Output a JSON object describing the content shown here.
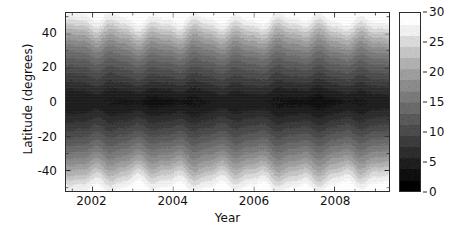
{
  "figure": {
    "kind": "filled-contour-heatmap",
    "background_color": "#ffffff",
    "axis_color": "#2b2b2b"
  },
  "xaxis": {
    "label": "Year",
    "ticks": [
      "2002",
      "2004",
      "2006",
      "2008"
    ],
    "tick_values": [
      2002,
      2004,
      2006,
      2008
    ],
    "range": [
      2001.35,
      2009.35
    ],
    "minor_tick_step": 0.5
  },
  "yaxis": {
    "label": "Latitude (degrees)",
    "ticks": [
      "40",
      "20",
      "0",
      "-20",
      "-40"
    ],
    "tick_values": [
      40,
      20,
      0,
      -20,
      -40
    ],
    "range": [
      -52,
      52
    ],
    "minor_tick_step": 10
  },
  "colorbar": {
    "label": "Velocity (m/s)",
    "ticks": [
      "30",
      "25",
      "20",
      "15",
      "10",
      "5",
      "0"
    ],
    "tick_values": [
      30,
      25,
      20,
      15,
      10,
      5,
      0
    ],
    "range": [
      0,
      30
    ],
    "orientation": "vertical",
    "discrete_levels": [
      0,
      2,
      4,
      6,
      8,
      10,
      12,
      14,
      16,
      18,
      20,
      22,
      24,
      26,
      28,
      30
    ],
    "band_colors": [
      "#000000",
      "#0f0f0f",
      "#1e1e1e",
      "#2d2d2d",
      "#3c3c3c",
      "#4b4b4b",
      "#5a5a5a",
      "#6a6a6a",
      "#7a7a7a",
      "#8b8b8b",
      "#9d9d9d",
      "#b0b0b0",
      "#c4c4c4",
      "#dadada",
      "#f0f0f0",
      "#ffffff"
    ]
  },
  "chart_data": {
    "type": "heatmap",
    "title": "",
    "xlabel": "Year",
    "ylabel": "Latitude (degrees)",
    "zlabel": "Velocity (m/s)",
    "xlim": [
      2001.35,
      2009.35
    ],
    "ylim": [
      -52,
      52
    ],
    "zlim": [
      0,
      30
    ],
    "grid": false,
    "legend_position": "right-colorbar",
    "latitude_profile": {
      "latitudes": [
        -52,
        -48,
        -44,
        -40,
        -36,
        -32,
        -28,
        -24,
        -20,
        -16,
        -12,
        -8,
        -4,
        0,
        4,
        8,
        12,
        16,
        20,
        24,
        28,
        32,
        36,
        40,
        44,
        48,
        52
      ],
      "mean_velocity": [
        29.0,
        27.4,
        25.0,
        22.2,
        19.6,
        17.4,
        15.4,
        13.4,
        11.6,
        9.8,
        8.0,
        6.2,
        4.6,
        3.6,
        4.6,
        6.2,
        8.0,
        9.8,
        11.6,
        13.4,
        15.4,
        17.6,
        20.0,
        22.6,
        25.4,
        27.8,
        29.2
      ]
    },
    "time_samples": [
      2001.4,
      2001.9,
      2002.4,
      2002.9,
      2003.4,
      2003.9,
      2004.4,
      2004.9,
      2005.4,
      2005.9,
      2006.4,
      2006.9,
      2007.4,
      2007.9,
      2008.4,
      2008.9,
      2009.3
    ],
    "equator_velocity_series": [
      4.0,
      3.6,
      3.2,
      3.8,
      3.4,
      2.9,
      2.6,
      3.1,
      2.8,
      3.3,
      2.7,
      3.0,
      3.4,
      3.1,
      3.5,
      3.8,
      4.1
    ],
    "high_latitude_velocity_series": [
      27.5,
      28.2,
      28.8,
      28.0,
      28.6,
      29.1,
      29.4,
      28.9,
      29.2,
      28.7,
      29.3,
      29.0,
      28.8,
      29.2,
      28.5,
      28.1,
      27.9
    ]
  }
}
